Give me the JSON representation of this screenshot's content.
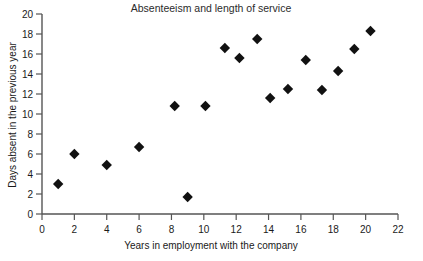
{
  "chart_data": {
    "type": "scatter",
    "title": "Absenteeism and length of service",
    "xlabel": "Years in employment with the company",
    "ylabel": "Days absent in the previous year",
    "xlim": [
      0,
      22
    ],
    "ylim": [
      0,
      20
    ],
    "xticks": [
      0,
      2,
      4,
      6,
      8,
      10,
      12,
      14,
      16,
      18,
      20,
      22
    ],
    "yticks": [
      0,
      2,
      4,
      6,
      8,
      10,
      12,
      14,
      16,
      18,
      20
    ],
    "grid": false,
    "legend": null,
    "marker": "diamond",
    "marker_color": "#111111",
    "points": [
      {
        "x": 1.0,
        "y": 3.0
      },
      {
        "x": 2.0,
        "y": 6.0
      },
      {
        "x": 4.0,
        "y": 4.9
      },
      {
        "x": 6.0,
        "y": 6.7
      },
      {
        "x": 8.2,
        "y": 10.8
      },
      {
        "x": 9.0,
        "y": 1.7
      },
      {
        "x": 10.1,
        "y": 10.8
      },
      {
        "x": 11.3,
        "y": 16.6
      },
      {
        "x": 12.2,
        "y": 15.6
      },
      {
        "x": 13.3,
        "y": 17.5
      },
      {
        "x": 14.1,
        "y": 11.6
      },
      {
        "x": 15.2,
        "y": 12.5
      },
      {
        "x": 16.3,
        "y": 15.4
      },
      {
        "x": 17.3,
        "y": 12.4
      },
      {
        "x": 18.3,
        "y": 14.3
      },
      {
        "x": 19.3,
        "y": 16.5
      },
      {
        "x": 20.3,
        "y": 18.3
      }
    ]
  }
}
